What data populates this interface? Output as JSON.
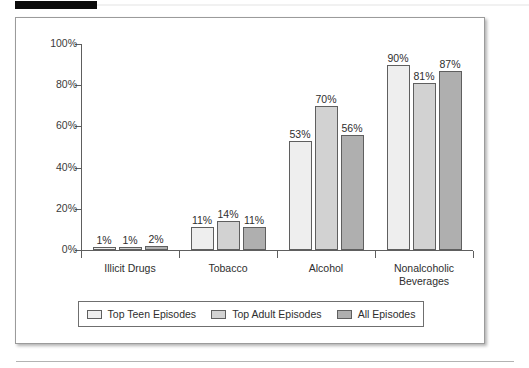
{
  "chart_data": {
    "type": "bar",
    "title": "",
    "xlabel": "",
    "ylabel": "",
    "ylim": [
      0,
      100
    ],
    "grid": false,
    "legend_position": "bottom",
    "categories": [
      "Illicit Drugs",
      "Tobacco",
      "Alcohol",
      "Nonalcoholic\nBeverages"
    ],
    "ytick_labels": [
      "0%",
      "20%",
      "40%",
      "60%",
      "80%",
      "100%"
    ],
    "ytick_values": [
      0,
      20,
      40,
      60,
      80,
      100
    ],
    "series": [
      {
        "name": "Top Teen Episodes",
        "color": "#eeeeee",
        "values": [
          1,
          11,
          53,
          90
        ],
        "value_labels": [
          "1%",
          "11%",
          "53%",
          "90%"
        ]
      },
      {
        "name": "Top Adult Episodes",
        "color": "#d2d2d2",
        "values": [
          1,
          14,
          70,
          81
        ],
        "value_labels": [
          "1%",
          "14%",
          "70%",
          "81%"
        ]
      },
      {
        "name": "All Episodes",
        "color": "#afafaf",
        "values": [
          2,
          11,
          56,
          87
        ],
        "value_labels": [
          "2%",
          "11%",
          "56%",
          "87%"
        ]
      }
    ]
  },
  "colors": {
    "axis": "#5e5e5e",
    "frame_border": "#9b9b9b",
    "text": "#2e2e2e",
    "top_bar": "#0a0a0a"
  }
}
